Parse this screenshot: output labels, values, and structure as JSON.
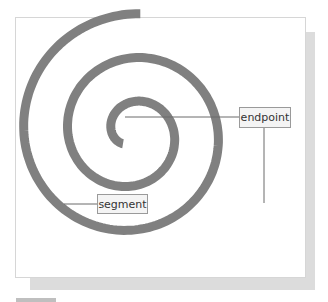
{
  "figure": {
    "colors": {
      "spiral": "#808080",
      "leader_line": "#6a6a6a",
      "shadow": "#dcdcdc",
      "frame_border": "#d6d6d6"
    },
    "spiral": {
      "center_x": 132,
      "center_y": 133,
      "start_radius": 14,
      "growth_per_turn": 44,
      "start_angle_deg": 230,
      "turns": 2.4,
      "stroke_width": 9
    },
    "labels": [
      {
        "id": "endpoint",
        "text": "endpoint",
        "box": {
          "x": 239,
          "y": 107,
          "w": 52,
          "h": 21
        }
      },
      {
        "id": "segment",
        "text": "segment",
        "box": {
          "x": 97,
          "y": 194,
          "w": 51,
          "h": 20
        }
      }
    ],
    "leaders": [
      {
        "from": [
          125,
          117
        ],
        "to": [
          239,
          117
        ]
      },
      {
        "from": [
          264,
          128
        ],
        "to": [
          264,
          203
        ]
      },
      {
        "from": [
          64,
          204
        ],
        "to": [
          97,
          204
        ]
      }
    ]
  }
}
